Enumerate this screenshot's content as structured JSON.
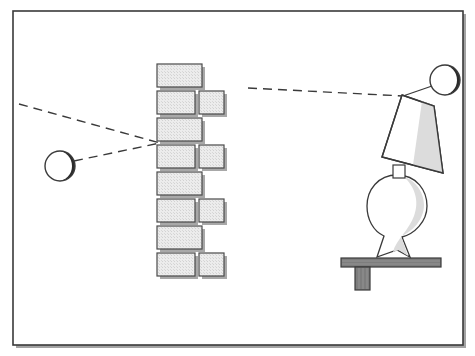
{
  "document": {
    "title": "Light Source, Wall and Lamp Diagram",
    "type": "line-art illustration",
    "canvas": {
      "width": 475,
      "height": 356
    },
    "background_color": "#ffffff",
    "has_text": false
  },
  "frame": {
    "name": "outer border frame",
    "x": 13,
    "y": 11,
    "width": 450,
    "height": 334,
    "stroke_color": "#3a3a3a",
    "stroke_width": 1.6,
    "shadow_color": "#9a9a9a",
    "shadow_offset": 3,
    "fill": "#ffffff"
  },
  "palette": {
    "outline": "#3a3a3a",
    "brick_fill": "#e9e9e9",
    "brick_texture": "#cfcfcf",
    "brick_shadow": "#a8a8a8",
    "sphere_fill": "#ffffff",
    "sphere_crescent": "#2b2b2b",
    "shade_fill": "#ffffff",
    "shade_highlight": "#dcdcdc",
    "base_fill": "#ffffff",
    "base_highlight": "#dcdcdc",
    "table_fill": "#7d7d7d",
    "table_stroke": "#3a3a3a",
    "dash_color": "#3a3a3a",
    "ray_color": "#3a3a3a"
  },
  "objects": {
    "left_sphere": {
      "label": "light source sphere (left)",
      "cx": 60,
      "cy": 166,
      "r": 15,
      "crescent_side": "right",
      "fill": "#ffffff",
      "stroke": "#3a3a3a"
    },
    "right_sphere": {
      "label": "light source sphere (right, above lamp)",
      "cx": 445,
      "cy": 80,
      "r": 15,
      "crescent_side": "right",
      "fill": "#ffffff",
      "stroke": "#3a3a3a"
    },
    "wall": {
      "label": "brick wall (vertical, center)",
      "left": 157,
      "top": 64,
      "rows": 8,
      "row_height": 27,
      "wide_brick": {
        "width": 45,
        "height": 23
      },
      "narrow_brick": {
        "width": 25,
        "height": 23
      },
      "gap": 4,
      "pattern": [
        "wide",
        "wide+narrow",
        "wide",
        "wide+narrow",
        "wide",
        "wide+narrow",
        "wide",
        "wide+narrow"
      ]
    },
    "lamp": {
      "label": "tilted table lamp",
      "shade": {
        "name": "lampshade trapezoid",
        "points": "401,94 437,106 443,174 386,156",
        "tilt_deg": -18
      },
      "neck": {
        "x": 396,
        "y": 166,
        "width": 10,
        "height": 12
      },
      "base": {
        "name": "bulbous lamp base with flared foot",
        "cx": 397,
        "cy": 205,
        "rx": 28,
        "ry": 30
      },
      "table": {
        "name": "table top slab",
        "x": 341,
        "y": 258,
        "width": 100,
        "height": 9,
        "fill": "#7d7d7d"
      },
      "table_leg": {
        "name": "table leg",
        "x": 355,
        "y": 267,
        "width": 15,
        "height": 23,
        "fill": "#7d7d7d"
      }
    }
  },
  "rays": {
    "convergence_point": {
      "x": 160,
      "y": 143,
      "label": "rays meet at wall face"
    },
    "dashed_lines": [
      {
        "name": "upper-left incoming ray",
        "from": {
          "x": 19,
          "y": 104
        },
        "to": {
          "x": 160,
          "y": 143
        },
        "style": "dashed"
      },
      {
        "name": "lower-left ray from sphere to wall",
        "from": {
          "x": 74,
          "y": 161
        },
        "to": {
          "x": 160,
          "y": 143
        },
        "style": "dashed"
      },
      {
        "name": "right ray to lamp shade top",
        "from": {
          "x": 248,
          "y": 88
        },
        "to": {
          "x": 403,
          "y": 96
        },
        "style": "dashed"
      },
      {
        "name": "ray from lamp top to right sphere",
        "from": {
          "x": 403,
          "y": 96
        },
        "to": {
          "x": 433,
          "y": 86
        },
        "style": "solid"
      }
    ]
  }
}
